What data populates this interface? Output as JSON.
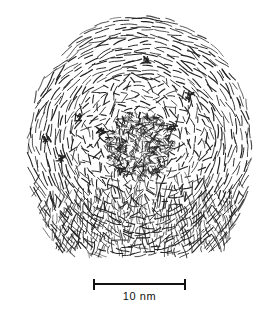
{
  "figure": {
    "kind": "lattice-fringe-drawing",
    "background_color": "#ffffff",
    "ink_color": "#1a1a1a",
    "width": 276,
    "height": 315
  },
  "scalebar": {
    "label": "10 nm",
    "value": 10,
    "unit": "nm",
    "x_start": 93,
    "x_end": 186,
    "y": 284,
    "bar_length_px": 93,
    "cap_height": 11,
    "line_thickness": 2,
    "label_x": 93,
    "label_y": 290,
    "label_width": 93,
    "color": "#111111"
  },
  "particle": {
    "center_x": 140,
    "center_y": 146,
    "outline_top_y": 13,
    "outline_bottom_y": 258,
    "outline_left_x": 25,
    "outline_right_x": 253,
    "dome_radius_x": 114,
    "dome_radius_y": 133,
    "core_radius": 34,
    "shell_count": 34,
    "shell_spacing": 3.6,
    "fringe_color": "#222222",
    "fringe_width": 0.95,
    "random_seed": 20250714,
    "zones": [
      {
        "name": "amorphous-core",
        "inner": 0,
        "outer": 34,
        "order": 0.04,
        "density": 0.95,
        "dash_len": 5.5
      },
      {
        "name": "transition-shells",
        "inner": 34,
        "outer": 72,
        "order": 0.55,
        "density": 1.0,
        "dash_len": 8.5
      },
      {
        "name": "concentric-shells",
        "inner": 72,
        "outer": 118,
        "order": 0.88,
        "density": 1.0,
        "dash_len": 13.0
      },
      {
        "name": "outer-rim",
        "inner": 118,
        "outer": 145,
        "order": 0.95,
        "density": 1.0,
        "dash_len": 15.0
      }
    ],
    "basal_band": {
      "name": "bottom-vertical-fringes",
      "top_y": 196,
      "bottom_y": 258,
      "left_x": 38,
      "right_x": 246,
      "orientation": "near-vertical",
      "dash_len": 12.0
    }
  }
}
